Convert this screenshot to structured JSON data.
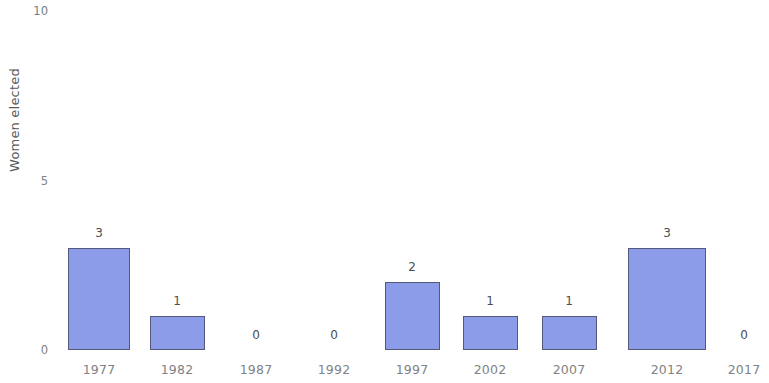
{
  "chart_data": {
    "type": "bar",
    "title": "",
    "subtitle": "",
    "xlabel": "",
    "ylabel": "Women elected",
    "categories": [
      "1977",
      "1982",
      "1987",
      "1992",
      "1997",
      "2002",
      "2007",
      "2012",
      "2017"
    ],
    "values": [
      3,
      1,
      0,
      0,
      2,
      1,
      1,
      3,
      0
    ],
    "value_labels": [
      "3",
      "1",
      "0",
      "0",
      "2",
      "1",
      "1",
      "3",
      "0"
    ],
    "ylim": [
      0,
      10
    ],
    "yticks": [
      "0",
      "5",
      "10"
    ],
    "ytick_values": [
      0,
      5,
      10
    ],
    "grid": false,
    "legend": null,
    "bar_color": "#8c9ce9",
    "bar_border_color": "#54587d",
    "axis_text_color": "#808285",
    "value_text_color": "#4d4d4f",
    "axis_title_color": "#58595b",
    "background_color": "#ffffff"
  }
}
